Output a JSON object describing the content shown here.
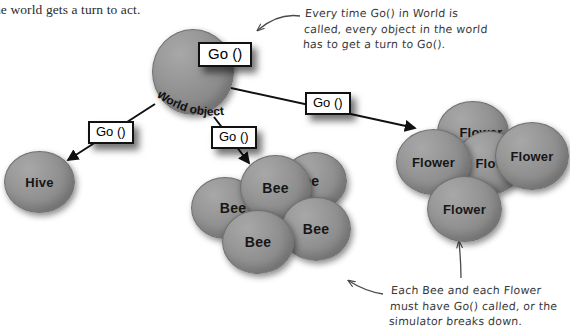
{
  "page": {
    "width": 570,
    "height": 335,
    "background": "#ffffff"
  },
  "body_text": {
    "line": "he world gets a turn to act."
  },
  "annotations": {
    "top_note": "Every time Go() in World is\ncalled, every object in the world\nhas to get a turn to Go().",
    "bottom_note": "Each Bee and each Flower\nmust have Go() called, or the\nsimulator breaks down."
  },
  "callouts": [
    {
      "id": "go-world",
      "label": "Go ()"
    },
    {
      "id": "go-hive",
      "label": "Go ()"
    },
    {
      "id": "go-bees",
      "label": "Go ()"
    },
    {
      "id": "go-flowers",
      "label": "Go ()"
    }
  ],
  "objects": {
    "world": {
      "label": "World object",
      "shape_label": ""
    },
    "hive": {
      "label": "Hive"
    },
    "bees": [
      {
        "label": "Bee"
      },
      {
        "label": "Bee"
      },
      {
        "label": "Bee"
      },
      {
        "label": "Bee"
      },
      {
        "label": "Bee"
      }
    ],
    "flowers": [
      {
        "label": "Flower"
      },
      {
        "label": "Flower"
      },
      {
        "label": "Flower"
      },
      {
        "label": "Flower"
      },
      {
        "label": "Flower"
      }
    ]
  },
  "colors": {
    "object_fill": "#8b8b8b",
    "object_stroke": "#6f6f6f",
    "callout_border": "#111111",
    "callout_background": "#ffffff",
    "text": "#161616",
    "handwriting": "#3a3a3a",
    "body_text": "#2b2b2b"
  }
}
